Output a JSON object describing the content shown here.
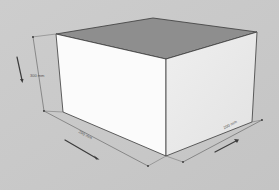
{
  "diagram": {
    "type": "3d-box-isometric",
    "colors": {
      "background": "#c9c9c9",
      "top_face": "#8e8e8e",
      "left_face": "#fbfbfb",
      "right_face": "#ececec",
      "edges": "#3a3a3a",
      "dimension_lines": "#6a6a6a",
      "arrows": "#3c3c3c"
    },
    "dimensions": {
      "height": {
        "label": "300 mm"
      },
      "width": {
        "label": "200 mm"
      },
      "depth": {
        "label": "200 mm"
      }
    }
  }
}
